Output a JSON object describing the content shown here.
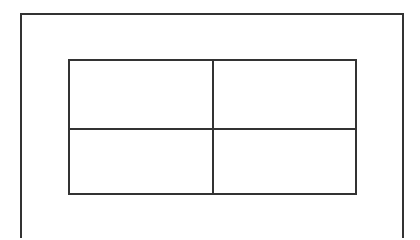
{
  "diagram": {
    "outer_frame": {
      "stroke": "#333333"
    },
    "grid": {
      "rows": 2,
      "cols": 2,
      "stroke": "#333333",
      "cells": [
        {
          "row": 0,
          "col": 0,
          "label": ""
        },
        {
          "row": 0,
          "col": 1,
          "label": ""
        },
        {
          "row": 1,
          "col": 0,
          "label": ""
        },
        {
          "row": 1,
          "col": 1,
          "label": ""
        }
      ]
    }
  }
}
